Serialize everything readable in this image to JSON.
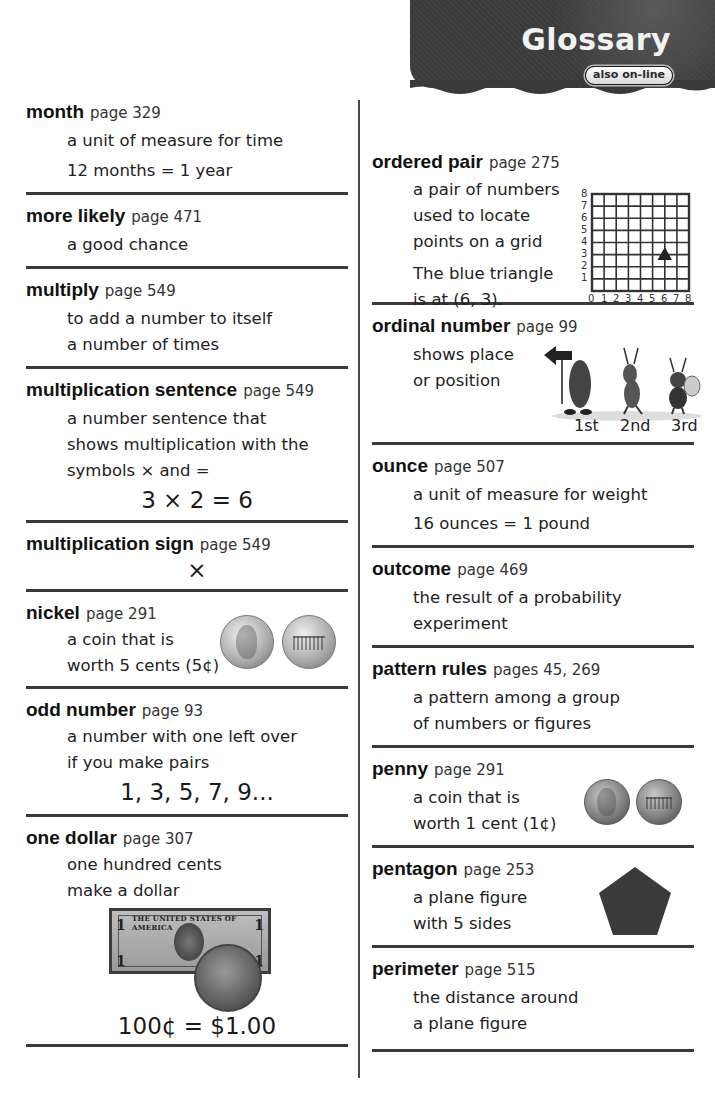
{
  "header": {
    "title": "Glossary",
    "badge": "also on-line"
  },
  "left_column": [
    {
      "term": "month",
      "page": "page 329",
      "definition": [
        "a unit of measure for time",
        "12 months = 1 year"
      ]
    },
    {
      "term": "more likely",
      "page": "page 471",
      "definition": [
        "a good chance"
      ]
    },
    {
      "term": "multiply",
      "page": "page 549",
      "definition": [
        "to add a number to itself",
        "a number of times"
      ]
    },
    {
      "term": "multiplication sentence",
      "page": "page 549",
      "definition": [
        "a number sentence that",
        "shows multiplication with the",
        "symbols × and ="
      ],
      "example": "3 × 2 = 6"
    },
    {
      "term": "multiplication sign",
      "page": "page 549",
      "example": "×"
    },
    {
      "term": "nickel",
      "page": "page 291",
      "definition": [
        "a coin that is",
        "worth 5 cents (5¢)"
      ],
      "image": "nickel-coins-front-and-back"
    },
    {
      "term": "odd number",
      "page": "page 93",
      "definition": [
        "a number with one left over",
        "if you make pairs"
      ],
      "example": "1, 3, 5, 7, 9..."
    },
    {
      "term": "one dollar",
      "page": "page 307",
      "definition": [
        "one hundred cents",
        "make a dollar"
      ],
      "image": "dollar-bill-and-dollar-coin",
      "bill_text": "THE UNITED STATES OF AMERICA",
      "example": "100¢ = $1.00"
    }
  ],
  "right_column": [
    {
      "term": "ordered pair",
      "page": "page 275",
      "definition": [
        "a pair of numbers",
        "used to locate",
        "points on a grid"
      ],
      "note": [
        "The blue triangle",
        "is at (6, 3)."
      ],
      "grid": {
        "x_labels": [
          "0",
          "1",
          "2",
          "3",
          "4",
          "5",
          "6",
          "7",
          "8"
        ],
        "y_labels": [
          "1",
          "2",
          "3",
          "4",
          "5",
          "6",
          "7",
          "8"
        ],
        "point": {
          "x": 6,
          "y": 3,
          "shape": "triangle"
        }
      }
    },
    {
      "term": "ordinal number",
      "page": "page 99",
      "definition": [
        "shows place",
        "or position"
      ],
      "image": "three-bugs-in-a-line",
      "positions": [
        "1st",
        "2nd",
        "3rd"
      ]
    },
    {
      "term": "ounce",
      "page": "page 507",
      "definition": [
        "a unit of measure for weight",
        "16 ounces = 1 pound"
      ]
    },
    {
      "term": "outcome",
      "page": "page 469",
      "definition": [
        "the result of a probability",
        "experiment"
      ]
    },
    {
      "term": "pattern rules",
      "page": "pages 45, 269",
      "definition": [
        "a pattern among a group",
        "of numbers or figures"
      ]
    },
    {
      "term": "penny",
      "page": "page 291",
      "definition": [
        "a coin that is",
        "worth 1 cent (1¢)"
      ],
      "image": "penny-coins-front-and-back"
    },
    {
      "term": "pentagon",
      "page": "page 253",
      "definition": [
        "a plane figure",
        "with 5 sides"
      ],
      "image": "pentagon-shape"
    },
    {
      "term": "perimeter",
      "page": "page 515",
      "definition": [
        "the distance around",
        "a plane figure"
      ]
    }
  ]
}
